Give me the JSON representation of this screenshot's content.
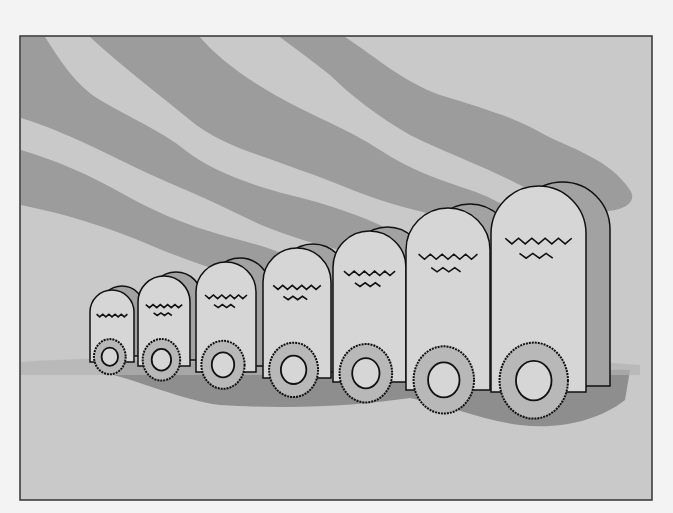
{
  "illustration": {
    "subject": "Row of seven tombstones with wreaths, graded small to large, under streaked gray sky",
    "tombstone_count": 7,
    "inscriptions": [
      "illegible scribble",
      "illegible scribble",
      "illegible scribble",
      "illegible scribble",
      "illegible scribble",
      "illegible scribble",
      "illegible scribble"
    ],
    "colors": {
      "page": "#f3f3f3",
      "frame_border": "#333333",
      "background": "#c9c9c9",
      "sky_band": "#9c9c9c",
      "stone_face": "#d6d6d6",
      "stone_side": "#a2a2a2",
      "shadow": "#8e8e8e",
      "outline": "#111111",
      "wreath": "#b8b8b8"
    }
  }
}
